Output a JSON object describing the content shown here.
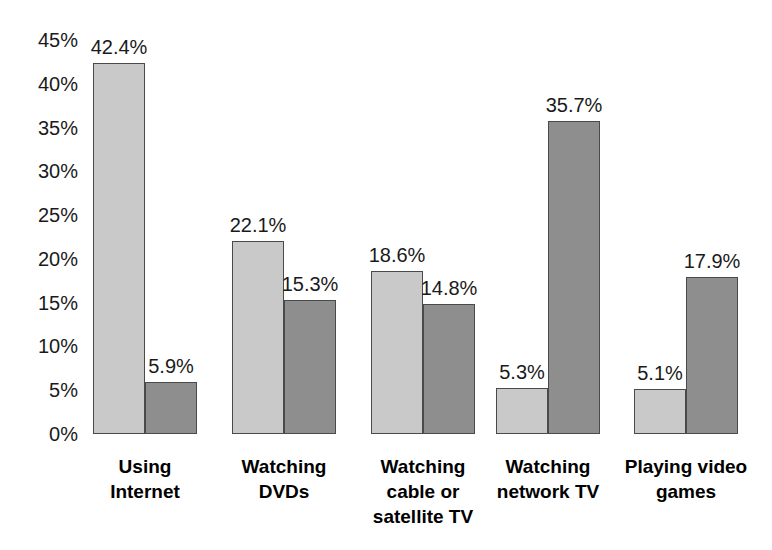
{
  "chart_data": {
    "type": "bar",
    "title": "",
    "subtitle": "",
    "xlabel": "",
    "ylabel": "",
    "categories": [
      "Using\nInternet",
      "Watching\nDVDs",
      "Watching\ncable or\nsatellite TV",
      "Watching\nnetwork TV",
      "Playing video\ngames"
    ],
    "series": [
      {
        "name": "Series 1",
        "color": "#c9c9c9",
        "values": [
          42.4,
          22.1,
          18.6,
          5.3,
          5.1
        ],
        "labels": [
          "42.4%",
          "22.1%",
          "18.6%",
          "5.3%",
          "5.1%"
        ]
      },
      {
        "name": "Series 2",
        "color": "#8e8e8e",
        "values": [
          5.9,
          15.3,
          14.8,
          35.7,
          17.9
        ],
        "labels": [
          "5.9%",
          "15.3%",
          "14.8%",
          "35.7%",
          "17.9%"
        ]
      }
    ],
    "ylim": [
      0,
      45
    ],
    "ytick_values": [
      0,
      5,
      10,
      15,
      20,
      25,
      30,
      35,
      40,
      45
    ],
    "ytick_labels": [
      "0%",
      "5%",
      "10%",
      "15%",
      "20%",
      "25%",
      "30%",
      "35%",
      "40%",
      "45%"
    ],
    "grid": false,
    "legend": "none",
    "bar_border_color": "#4a4a4a",
    "background": "#ffffff"
  }
}
